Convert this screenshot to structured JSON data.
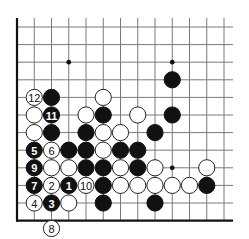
{
  "diagram": {
    "type": "go-board-fragment",
    "grid": {
      "origin_x": 17,
      "origin_y": 27,
      "spacing_x": 17.25,
      "spacing_y": 17.6,
      "columns": 13,
      "rows": 12,
      "line_extend_right": 233,
      "line_extend_top": 18,
      "left_edge": true,
      "bottom_edge": true,
      "line_color": "#7a7a7a",
      "edge_color": "#111111"
    },
    "star_points": [
      {
        "col": 3,
        "row": 2
      },
      {
        "col": 9,
        "row": 2
      },
      {
        "col": 9,
        "row": 8
      }
    ],
    "stones": [
      {
        "color": "black",
        "col": 9,
        "row": 3,
        "label": ""
      },
      {
        "color": "white",
        "col": 1,
        "row": 4,
        "label": "12"
      },
      {
        "color": "black",
        "col": 2,
        "row": 4,
        "label": ""
      },
      {
        "color": "white",
        "col": 5,
        "row": 4,
        "label": ""
      },
      {
        "color": "white",
        "col": 1,
        "row": 5,
        "label": ""
      },
      {
        "color": "black",
        "col": 2,
        "row": 5,
        "label": "11"
      },
      {
        "color": "white",
        "col": 4,
        "row": 5,
        "label": ""
      },
      {
        "color": "black",
        "col": 5,
        "row": 5,
        "label": ""
      },
      {
        "color": "white",
        "col": 7,
        "row": 5,
        "label": ""
      },
      {
        "color": "black",
        "col": 9,
        "row": 5,
        "label": ""
      },
      {
        "color": "white",
        "col": 1,
        "row": 6,
        "label": ""
      },
      {
        "color": "black",
        "col": 2,
        "row": 6,
        "label": ""
      },
      {
        "color": "black",
        "col": 4,
        "row": 6,
        "label": ""
      },
      {
        "color": "white",
        "col": 5,
        "row": 6,
        "label": ""
      },
      {
        "color": "white",
        "col": 6,
        "row": 6,
        "label": ""
      },
      {
        "color": "black",
        "col": 8,
        "row": 6,
        "label": ""
      },
      {
        "color": "black",
        "col": 1,
        "row": 7,
        "label": "5"
      },
      {
        "color": "white",
        "col": 2,
        "row": 7,
        "label": "6"
      },
      {
        "color": "black",
        "col": 3,
        "row": 7,
        "label": ""
      },
      {
        "color": "black",
        "col": 4,
        "row": 7,
        "label": ""
      },
      {
        "color": "white",
        "col": 5,
        "row": 7,
        "label": ""
      },
      {
        "color": "black",
        "col": 6,
        "row": 7,
        "label": ""
      },
      {
        "color": "black",
        "col": 7,
        "row": 7,
        "label": ""
      },
      {
        "color": "black",
        "col": 1,
        "row": 8,
        "label": "9"
      },
      {
        "color": "white",
        "col": 2,
        "row": 8,
        "label": ""
      },
      {
        "color": "white",
        "col": 3,
        "row": 8,
        "label": ""
      },
      {
        "color": "black",
        "col": 4,
        "row": 8,
        "label": ""
      },
      {
        "color": "black",
        "col": 5,
        "row": 8,
        "label": ""
      },
      {
        "color": "white",
        "col": 6,
        "row": 8,
        "label": ""
      },
      {
        "color": "black",
        "col": 7,
        "row": 8,
        "label": ""
      },
      {
        "color": "white",
        "col": 8,
        "row": 8,
        "label": ""
      },
      {
        "color": "white",
        "col": 11,
        "row": 8,
        "label": ""
      },
      {
        "color": "black",
        "col": 1,
        "row": 9,
        "label": "7"
      },
      {
        "color": "white",
        "col": 2,
        "row": 9,
        "label": "2"
      },
      {
        "color": "black",
        "col": 3,
        "row": 9,
        "label": "1"
      },
      {
        "color": "white",
        "col": 4,
        "row": 9,
        "label": "10"
      },
      {
        "color": "black",
        "col": 5,
        "row": 9,
        "label": ""
      },
      {
        "color": "white",
        "col": 6,
        "row": 9,
        "label": ""
      },
      {
        "color": "white",
        "col": 7,
        "row": 9,
        "label": ""
      },
      {
        "color": "white",
        "col": 8,
        "row": 9,
        "label": ""
      },
      {
        "color": "white",
        "col": 9,
        "row": 9,
        "label": ""
      },
      {
        "color": "white",
        "col": 10,
        "row": 9,
        "label": ""
      },
      {
        "color": "black",
        "col": 11,
        "row": 9,
        "label": ""
      },
      {
        "color": "white",
        "col": 1,
        "row": 10,
        "label": "4"
      },
      {
        "color": "black",
        "col": 2,
        "row": 10,
        "label": "3"
      },
      {
        "color": "white",
        "col": 3,
        "row": 10,
        "label": ""
      },
      {
        "color": "black",
        "col": 5,
        "row": 10,
        "label": ""
      },
      {
        "color": "black",
        "col": 8,
        "row": 10,
        "label": ""
      },
      {
        "color": "white",
        "col": 2,
        "row": 11.45,
        "label": "8"
      }
    ]
  }
}
